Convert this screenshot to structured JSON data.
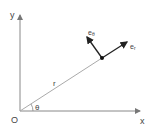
{
  "diagram": {
    "labels": {
      "y_axis": "y",
      "x_axis": "x",
      "origin": "O",
      "angle": "θ",
      "radius": "r",
      "e_theta_base": "e",
      "e_theta_sub": "θ",
      "e_r_base": "e",
      "e_r_sub": "r"
    },
    "colors": {
      "axis": "#888888",
      "radius_line": "#aaaaaa",
      "vector": "#333333",
      "point": "#111111"
    }
  }
}
